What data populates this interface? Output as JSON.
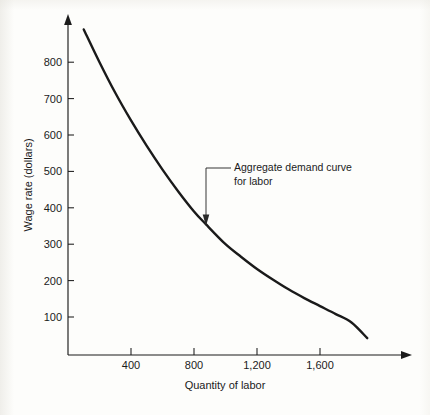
{
  "chart_data": {
    "type": "line",
    "title": "",
    "subtitle": "",
    "xlabel": "Quantity of labor",
    "ylabel": "Wage rate (dollars)",
    "xlim": [
      0,
      2100
    ],
    "ylim": [
      0,
      950
    ],
    "grid": false,
    "legend": "none",
    "x_ticks": [
      400,
      800,
      1200,
      1600
    ],
    "x_tick_labels": [
      "400",
      "800",
      "1,200",
      "1,600"
    ],
    "y_ticks": [
      100,
      200,
      300,
      400,
      500,
      600,
      700,
      800
    ],
    "y_tick_labels": [
      "100",
      "200",
      "300",
      "400",
      "500",
      "600",
      "700",
      "800"
    ],
    "series": [
      {
        "name": "Aggregate demand curve for labor",
        "x": [
          100,
          200,
          300,
          400,
          500,
          600,
          700,
          800,
          875,
          1000,
          1100,
          1200,
          1300,
          1400,
          1500,
          1600,
          1700,
          1800,
          1900
        ],
        "y": [
          890,
          800,
          716,
          640,
          570,
          505,
          445,
          390,
          355,
          300,
          265,
          232,
          203,
          176,
          152,
          130,
          108,
          85,
          42
        ]
      }
    ],
    "annotations": [
      {
        "text_line1": "Aggregate demand curve",
        "text_line2": "for labor",
        "points_to_x": 875,
        "points_to_y": 355,
        "arrow": "down"
      }
    ],
    "axis_arrows": {
      "x_axis": "right",
      "y_axis": "up"
    },
    "curve_color": "#1a1a1a",
    "axis_color": "#1b1b1b",
    "background_color": "#fdfdfb"
  }
}
